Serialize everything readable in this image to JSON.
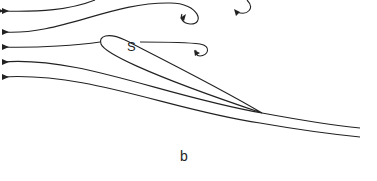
{
  "diagram": {
    "airfoil_label": "S",
    "panel_label": "b",
    "streamline_count": 5,
    "vortex_count": 3,
    "colors": {
      "line": "#222222",
      "background": "#ffffff"
    }
  }
}
